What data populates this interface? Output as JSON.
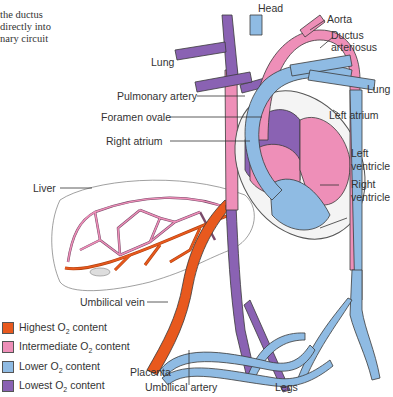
{
  "caption": {
    "lines": [
      "the ductus",
      "directly into",
      "nary circuit"
    ]
  },
  "labels": {
    "head": "Head",
    "aorta": "Aorta",
    "ductus_arteriosus_1": "Ductus",
    "ductus_arteriosus_2": "arteriosus",
    "lung_left": "Lung",
    "lung_right": "Lung",
    "pulmonary_artery": "Pulmonary artery",
    "foramen_ovale": "Foramen ovale",
    "left_atrium": "Left atrium",
    "right_atrium": "Right atrium",
    "left_ventricle_1": "Left",
    "left_ventricle_2": "ventricle",
    "right_ventricle_1": "Right",
    "right_ventricle_2": "ventricle",
    "liver": "Liver",
    "umbilical_vein": "Umbilical vein",
    "placenta": "Placenta",
    "umbilical_artery": "Umbilical artery",
    "legs": "Legs"
  },
  "legend": {
    "items": [
      {
        "pre": "Highest O",
        "sub": "2",
        "post": " content",
        "color": "#e8591e"
      },
      {
        "pre": "Intermediate O",
        "sub": "2",
        "post": " content",
        "color": "#ee8fb8"
      },
      {
        "pre": "Lower O",
        "sub": "2",
        "post": " content",
        "color": "#8fbbe3"
      },
      {
        "pre": "Lowest O",
        "sub": "2",
        "post": " content",
        "color": "#8a62b3"
      }
    ]
  },
  "colors": {
    "highest": "#e8591e",
    "intermediate": "#ee8fb8",
    "lower": "#8fbbe3",
    "lowest": "#8a62b3",
    "outline": "#3a3a3a"
  }
}
